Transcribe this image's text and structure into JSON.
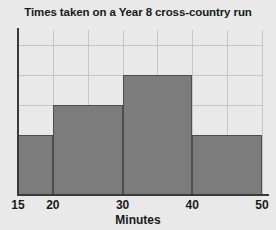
{
  "chart_data": {
    "type": "bar",
    "title": "Times taken on a Year 8 cross-country run",
    "xlabel": "Minutes",
    "ylabel": "",
    "grid": true,
    "legend": false,
    "xlim": [
      15,
      50
    ],
    "ylim": [
      0,
      5.5
    ],
    "xticks": [
      "15",
      "20",
      "30",
      "40",
      "50"
    ],
    "xtick_values": [
      15,
      20,
      30,
      40,
      50
    ],
    "ytick_values": [
      1,
      2,
      3,
      4,
      5
    ],
    "bin_edges": [
      15,
      20,
      30,
      40,
      50
    ],
    "categories": [
      "15-20",
      "20-30",
      "30-40",
      "40-50"
    ],
    "values": [
      2,
      3,
      4,
      2
    ],
    "bars": [
      {
        "label": "15-20",
        "start": 15,
        "end": 20,
        "value": 2
      },
      {
        "label": "20-30",
        "start": 20,
        "end": 30,
        "value": 3
      },
      {
        "label": "30-40",
        "start": 30,
        "end": 40,
        "value": 4
      },
      {
        "label": "40-50",
        "start": 40,
        "end": 50,
        "value": 2
      }
    ],
    "colors": {
      "bar_fill": "#7c7c7c",
      "bar_edge": "#4d4d4d",
      "background": "#e9e9e9",
      "gridline": "#c6c6c6",
      "axis": "#3a3a3a",
      "text": "#1a1a1a"
    }
  }
}
